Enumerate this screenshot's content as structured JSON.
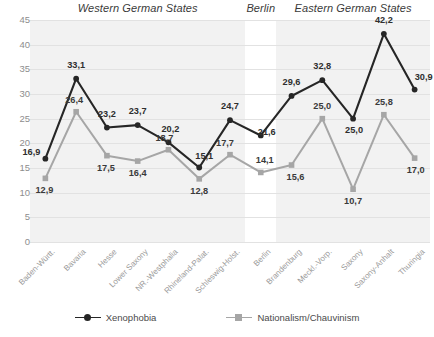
{
  "chart_data": {
    "type": "line",
    "title": "",
    "xlabel": "",
    "ylabel": "",
    "ylim": [
      0,
      45
    ],
    "yticks": [
      0,
      5,
      10,
      15,
      20,
      25,
      30,
      35,
      40,
      45
    ],
    "grid": true,
    "legend_position": "bottom",
    "categories": [
      "Baden-Württ.",
      "Bavaria",
      "Hesse",
      "Lower Saxony",
      "NR.-Westphalia",
      "Rhineland-Palat.",
      "Schleswig-Holst.",
      "Berlin",
      "Brandenburg",
      "Meckl.-Vorp.",
      "Saxony",
      "Saxony-Anhalt",
      "Thuringia"
    ],
    "series": [
      {
        "name": "Xenophobia",
        "color": "#262626",
        "marker": "circle",
        "values": [
          16.9,
          33.1,
          23.2,
          23.7,
          20.2,
          15.1,
          24.7,
          21.6,
          29.6,
          32.8,
          25.0,
          42.2,
          30.9
        ],
        "labels": [
          "16,9",
          "33,1",
          "23,2",
          "23,7",
          "20,2",
          "15,1",
          "24,7",
          "21,6",
          "29,6",
          "32,8",
          "25,0",
          "42,2",
          "30,9"
        ]
      },
      {
        "name": "Nationalism/Chauvinism",
        "color": "#a6a6a6",
        "marker": "square",
        "values": [
          12.9,
          26.4,
          17.5,
          16.4,
          18.7,
          12.8,
          17.7,
          14.1,
          15.6,
          25.0,
          10.7,
          25.8,
          17.0
        ],
        "labels": [
          "12,9",
          "26,4",
          "17,5",
          "16,4",
          "18,7",
          "12,8",
          "17,7",
          "14,1",
          "15,6",
          "25,0",
          "10,7",
          "25,8",
          "17,0"
        ]
      }
    ],
    "group_headers": [
      {
        "label": "Western German States",
        "first_index": 0,
        "last_index": 6
      },
      {
        "label": "Berlin",
        "first_index": 7,
        "last_index": 7
      },
      {
        "label": "Eastern German States",
        "first_index": 8,
        "last_index": 12
      }
    ],
    "ytick_labels": [
      "45",
      "40",
      "35",
      "30",
      "25",
      "20",
      "15",
      "10",
      "5",
      "0"
    ]
  },
  "legend": {
    "items": [
      {
        "label": "Xenophobia",
        "color": "#262626"
      },
      {
        "label": "Nationalism/Chauvinism",
        "color": "#a6a6a6"
      }
    ]
  },
  "colors": {
    "plot_background": "#f2f2f2",
    "highlight_band": "#ffffff",
    "gridline": "#e2e2e2",
    "axis_text": "#8d8d8d",
    "header_text": "#3a3a3a"
  }
}
